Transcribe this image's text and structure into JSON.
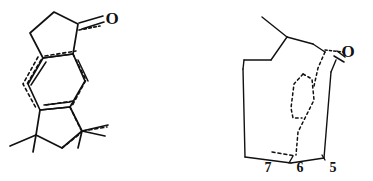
{
  "figure": {
    "kind": "chemical-structure-diagram",
    "background_color": "#ffffff",
    "ink_color": "#111111",
    "width": 373,
    "height": 181,
    "structure_count": 2
  },
  "structure_left": {
    "name": "tricyclic-aryl-ketone",
    "description": "Hand-drawn tricyclic structure: cyclopentanone fused to an aromatic six-membered ring fused to a gem-dimethyl cyclopentane, with dashed conformational overlay lines.",
    "atom_labels": [
      {
        "id": "O",
        "text": "O",
        "x": 112,
        "y": 24,
        "font_size": 17
      }
    ],
    "substituent_count": 3,
    "has_overlay_dashes": true
  },
  "structure_right": {
    "name": "bicyclic-cage-ketone",
    "description": "Hand-drawn bicyclic cage ketone drawn in perspective with a dashed interior loop and numbered ring positions along the lower edge.",
    "atom_labels": [
      {
        "id": "O",
        "text": "O",
        "x": 348,
        "y": 57,
        "font_size": 17
      }
    ],
    "position_labels": [
      {
        "id": "pos7",
        "text": "7",
        "x": 268,
        "y": 172,
        "font_size": 14
      },
      {
        "id": "pos6",
        "text": "6",
        "x": 300,
        "y": 172,
        "font_size": 14
      },
      {
        "id": "pos5",
        "text": "5",
        "x": 333,
        "y": 172,
        "font_size": 14
      }
    ],
    "has_overlay_dashes": true
  }
}
